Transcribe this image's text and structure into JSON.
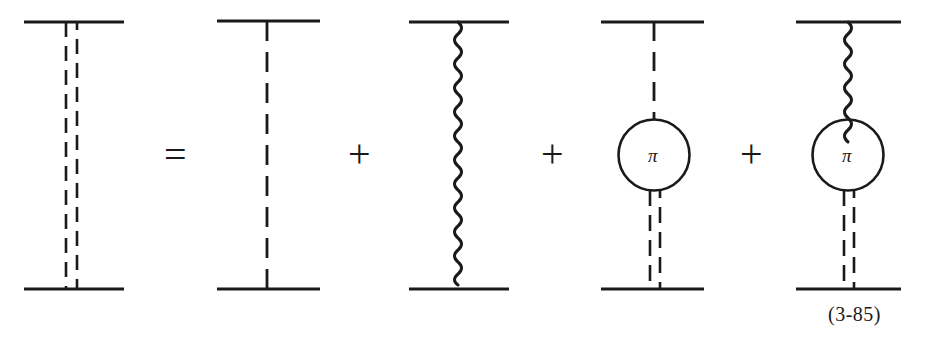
{
  "figure": {
    "kind": "feynman-diagram-equation",
    "equation_number": "(3-85)",
    "stroke_color": "#1a1a1a",
    "background_color": "#ffffff",
    "operators": [
      {
        "symbol": "=",
        "name": "equals-sign"
      },
      {
        "symbol": "+",
        "name": "plus-sign-1"
      },
      {
        "symbol": "+",
        "name": "plus-sign-2"
      },
      {
        "symbol": "+",
        "name": "plus-sign-3"
      }
    ],
    "terms": [
      {
        "index": 1,
        "name": "effective-interaction-term",
        "propagator": "double-dashed",
        "has_bubble": false,
        "bubble_label": null
      },
      {
        "index": 2,
        "name": "one-pion-exchange-term",
        "propagator": "single-dashed",
        "has_bubble": false,
        "bubble_label": null
      },
      {
        "index": 3,
        "name": "wavy-exchange-term",
        "propagator": "wavy",
        "has_bubble": false,
        "bubble_label": null
      },
      {
        "index": 4,
        "name": "pion-bubble-dashed-term",
        "propagator": "single-dashed-top-double-dashed-bottom",
        "has_bubble": true,
        "bubble_label": "π"
      },
      {
        "index": 5,
        "name": "pion-bubble-wavy-term",
        "propagator": "wavy-top-double-dashed-bottom",
        "has_bubble": true,
        "bubble_label": "π"
      }
    ]
  }
}
